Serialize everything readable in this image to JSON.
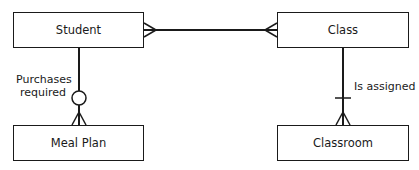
{
  "diagram": {
    "type": "entity-relationship",
    "entities": [
      {
        "id": "student",
        "label": "Student"
      },
      {
        "id": "class",
        "label": "Class"
      },
      {
        "id": "meal_plan",
        "label": "Meal Plan"
      },
      {
        "id": "classroom",
        "label": "Classroom"
      }
    ],
    "relationships": [
      {
        "from": "student",
        "to": "class",
        "label": "",
        "from_end": "many",
        "to_end": "many"
      },
      {
        "from": "student",
        "to": "meal_plan",
        "label_line1": "Purchases",
        "label_line2": "required",
        "from_end": "none",
        "to_end": "zero-or-many"
      },
      {
        "from": "class",
        "to": "classroom",
        "label": "Is assigned",
        "from_end": "none",
        "to_end": "one-or-many"
      }
    ],
    "colors": {
      "stroke": "#1a1a1a",
      "background": "#ffffff"
    }
  }
}
